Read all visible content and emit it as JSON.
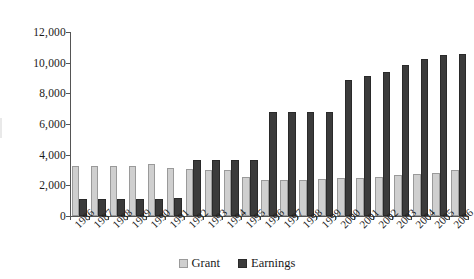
{
  "chart_data": {
    "type": "bar",
    "title": "",
    "subtitle": "",
    "xlabel": "",
    "ylabel": "",
    "ylim": [
      0,
      12000
    ],
    "ytick_values": [
      0,
      2000,
      4000,
      6000,
      8000,
      10000,
      12000
    ],
    "ytick_labels": [
      "0",
      "2,000",
      "4,000",
      "6,000",
      "8,000",
      "10,000",
      "12,000"
    ],
    "grid": false,
    "legend_position": "bottom-center",
    "categories": [
      "1986",
      "1987",
      "1988",
      "1989",
      "1990",
      "1991",
      "1992",
      "1993",
      "1994",
      "1995",
      "1996",
      "1997",
      "1998",
      "1999",
      "2000",
      "2001",
      "2002",
      "2003",
      "2004",
      "2005",
      "2006"
    ],
    "series": [
      {
        "name": "Grant",
        "color": "#cfcfcf",
        "values": [
          3250,
          3290,
          3290,
          3290,
          3370,
          3100,
          3080,
          3020,
          3030,
          2570,
          2360,
          2350,
          2360,
          2430,
          2450,
          2490,
          2550,
          2670,
          2760,
          2820,
          3020
        ]
      },
      {
        "name": "Earnings",
        "color": "#3b3b3b",
        "values": [
          1120,
          1130,
          1130,
          1130,
          1140,
          1160,
          3660,
          3670,
          3670,
          3680,
          6790,
          6790,
          6790,
          6800,
          8840,
          9110,
          9420,
          9850,
          10220,
          10470,
          10550
        ]
      }
    ]
  },
  "legend": {
    "items": [
      {
        "label": "Grant"
      },
      {
        "label": "Earnings"
      }
    ]
  }
}
